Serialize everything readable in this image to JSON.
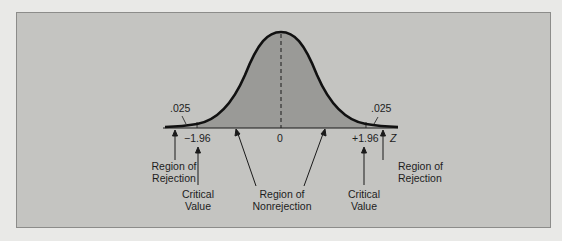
{
  "figure": {
    "type": "two-tail hypothesis test on standard normal distribution",
    "tail_area_left": ".025",
    "tail_area_right": ".025",
    "axis_variable": "Z",
    "ticks": {
      "left_critical": "−1.96",
      "center": "0",
      "right_critical": "+1.96"
    },
    "annotations": {
      "left_rejection": [
        "Region of",
        "Rejection"
      ],
      "left_critical": [
        "Critical",
        "Value"
      ],
      "nonrejection": [
        "Region of",
        "Nonrejection"
      ],
      "right_critical": [
        "Critical",
        "Value"
      ],
      "right_rejection": [
        "Region of",
        "Rejection"
      ]
    },
    "colors": {
      "page_background": "#e9e9e7",
      "panel_background": "#c4c4c1",
      "nonrejection_fill": "#9a9a97",
      "tail_fill": "#b0b0ad",
      "curve": "#111111"
    }
  }
}
